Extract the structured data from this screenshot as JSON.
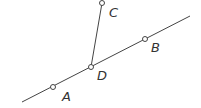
{
  "diagram": {
    "type": "geometry",
    "line_color": "#444444",
    "points": [
      {
        "label": "A",
        "x": 53,
        "y": 87,
        "lx": 62,
        "ly": 101
      },
      {
        "label": "B",
        "x": 145,
        "y": 39,
        "lx": 151,
        "ly": 52
      },
      {
        "label": "C",
        "x": 102,
        "y": 3,
        "lx": 109,
        "ly": 17
      },
      {
        "label": "D",
        "x": 91,
        "y": 67,
        "lx": 97,
        "ly": 80
      }
    ],
    "segments": [
      {
        "name": "line-AB",
        "from": [
          22,
          102
        ],
        "to": [
          190,
          16
        ]
      },
      {
        "name": "segment-DC",
        "from": [
          91,
          67
        ],
        "to": [
          102,
          3
        ]
      }
    ]
  }
}
